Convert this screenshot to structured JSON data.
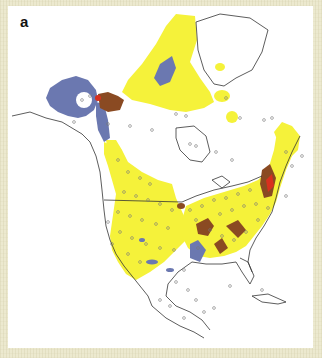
{
  "figure": {
    "panel_label": "a",
    "type": "map",
    "region": "North America",
    "legend": null
  },
  "colors": {
    "background_border": "#ece9cf",
    "panel_bg": "#ffffff",
    "yellow_region": "#f5f23a",
    "blue_region": "#6b78b0",
    "brown_region": "#8a4a22",
    "red_region": "#d8301e",
    "coastline": "#333333",
    "site_marker": "#777777"
  },
  "layers": [
    {
      "name": "yellow-range",
      "description": "Large yellow distribution area covering Arctic archipelago, western Canada, central/eastern US"
    },
    {
      "name": "blue-range",
      "description": "Blue/slate areas in Alaska, Yukon corridor, Gulf coast patches and Baffin region"
    },
    {
      "name": "brown-range",
      "description": "Brown patches in Mackenzie delta, southern US, Atlantic coast"
    },
    {
      "name": "red-range",
      "description": "Small red patches near Mackenzie delta and New England"
    },
    {
      "name": "sample-sites",
      "description": "Small open circles marking sample locations across the continent"
    }
  ]
}
